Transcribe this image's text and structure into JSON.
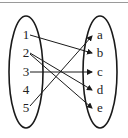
{
  "diagram": {
    "type": "mapping-diagram",
    "domain_set": [
      "1",
      "2",
      "3",
      "4",
      "5"
    ],
    "codomain_set": [
      "a",
      "b",
      "c",
      "d",
      "e"
    ],
    "mappings": [
      {
        "from": "1",
        "to": "b"
      },
      {
        "from": "2",
        "to": "d"
      },
      {
        "from": "2",
        "to": "e"
      },
      {
        "from": "3",
        "to": "c"
      },
      {
        "from": "5",
        "to": "a"
      }
    ],
    "colors": {
      "stroke": "#1a1a1a",
      "text": "#222222",
      "top_rule": "#9a9a9a"
    }
  },
  "labels": {
    "left": [
      "1",
      "2",
      "3",
      "4",
      "5"
    ],
    "right": [
      "a",
      "b",
      "c",
      "d",
      "e"
    ]
  }
}
